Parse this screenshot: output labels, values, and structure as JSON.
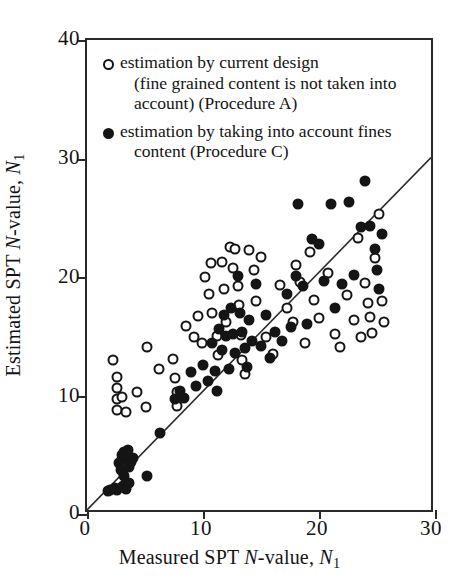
{
  "chart_data": {
    "type": "scatter",
    "title": "",
    "xlabel": "Measured SPT N-value, N1",
    "ylabel": "Estimated SPT N-value, N1",
    "xlim": [
      0,
      30
    ],
    "ylim": [
      0,
      40
    ],
    "xticks": [
      0,
      10,
      20,
      30
    ],
    "yticks": [
      0,
      10,
      20,
      30,
      40
    ],
    "grid": false,
    "legend_position": "upper-left-inside",
    "reference_line": {
      "name": "1:1 line",
      "from": [
        0,
        0
      ],
      "to": [
        30,
        30
      ],
      "style": "solid"
    },
    "series": [
      {
        "name": "estimation by current design (fine grained content is not taken into account) (Procedure A)",
        "marker": "open-circle",
        "color": "#151515",
        "points": [
          [
            2.2,
            13.0
          ],
          [
            2.6,
            11.6
          ],
          [
            2.6,
            10.6
          ],
          [
            2.6,
            9.7
          ],
          [
            2.6,
            8.8
          ],
          [
            3.0,
            9.9
          ],
          [
            3.4,
            8.6
          ],
          [
            4.3,
            10.3
          ],
          [
            5.1,
            9.0
          ],
          [
            5.2,
            14.1
          ],
          [
            6.2,
            12.2
          ],
          [
            7.4,
            13.1
          ],
          [
            7.6,
            11.5
          ],
          [
            7.8,
            10.3
          ],
          [
            7.8,
            9.1
          ],
          [
            8.5,
            15.9
          ],
          [
            9.2,
            14.9
          ],
          [
            9.6,
            16.7
          ],
          [
            9.9,
            14.4
          ],
          [
            10.2,
            20.0
          ],
          [
            10.5,
            18.6
          ],
          [
            10.7,
            21.2
          ],
          [
            10.8,
            17.0
          ],
          [
            11.2,
            15.0
          ],
          [
            11.3,
            13.4
          ],
          [
            11.6,
            21.3
          ],
          [
            11.8,
            19.0
          ],
          [
            12.0,
            16.2
          ],
          [
            12.3,
            22.5
          ],
          [
            12.6,
            20.8
          ],
          [
            12.8,
            22.4
          ],
          [
            13.0,
            19.2
          ],
          [
            13.1,
            17.6
          ],
          [
            13.3,
            15.1
          ],
          [
            13.4,
            13.0
          ],
          [
            13.6,
            11.8
          ],
          [
            14.0,
            22.3
          ],
          [
            14.4,
            20.6
          ],
          [
            14.6,
            18.0
          ],
          [
            15.0,
            21.7
          ],
          [
            15.4,
            14.9
          ],
          [
            16.0,
            13.5
          ],
          [
            16.6,
            19.3
          ],
          [
            17.2,
            17.4
          ],
          [
            17.8,
            16.2
          ],
          [
            18.0,
            21.0
          ],
          [
            18.4,
            19.6
          ],
          [
            18.8,
            14.4
          ],
          [
            19.2,
            22.1
          ],
          [
            19.6,
            18.1
          ],
          [
            20.0,
            16.5
          ],
          [
            20.8,
            20.3
          ],
          [
            21.4,
            15.2
          ],
          [
            21.8,
            14.1
          ],
          [
            22.4,
            18.5
          ],
          [
            23.0,
            16.4
          ],
          [
            23.4,
            23.3
          ],
          [
            23.6,
            14.9
          ],
          [
            24.0,
            19.5
          ],
          [
            24.2,
            17.8
          ],
          [
            24.4,
            16.6
          ],
          [
            24.6,
            15.3
          ],
          [
            24.8,
            21.6
          ],
          [
            25.2,
            25.3
          ],
          [
            25.4,
            18.0
          ],
          [
            25.6,
            16.2
          ]
        ]
      },
      {
        "name": "estimation by taking into account fines content (Procedure C)",
        "marker": "filled-circle",
        "color": "#151515",
        "points": [
          [
            1.8,
            1.9
          ],
          [
            2.0,
            2.0
          ],
          [
            2.4,
            2.2
          ],
          [
            2.6,
            2.0
          ],
          [
            2.8,
            4.3
          ],
          [
            2.9,
            3.7
          ],
          [
            3.0,
            5.0
          ],
          [
            3.0,
            4.6
          ],
          [
            3.1,
            2.4
          ],
          [
            3.2,
            5.2
          ],
          [
            3.2,
            3.2
          ],
          [
            3.3,
            4.9
          ],
          [
            3.4,
            2.1
          ],
          [
            3.5,
            5.4
          ],
          [
            3.6,
            4.0
          ],
          [
            3.6,
            2.6
          ],
          [
            3.8,
            4.4
          ],
          [
            4.0,
            4.7
          ],
          [
            5.2,
            3.2
          ],
          [
            6.3,
            6.8
          ],
          [
            7.6,
            9.7
          ],
          [
            8.0,
            10.4
          ],
          [
            8.4,
            9.8
          ],
          [
            9.0,
            12.0
          ],
          [
            9.4,
            10.8
          ],
          [
            10.0,
            12.6
          ],
          [
            10.4,
            11.2
          ],
          [
            10.8,
            14.4
          ],
          [
            11.0,
            12.1
          ],
          [
            11.2,
            10.4
          ],
          [
            11.4,
            15.6
          ],
          [
            11.6,
            13.8
          ],
          [
            11.8,
            16.8
          ],
          [
            12.0,
            15.0
          ],
          [
            12.2,
            12.2
          ],
          [
            12.4,
            17.4
          ],
          [
            12.6,
            15.2
          ],
          [
            12.8,
            13.6
          ],
          [
            13.0,
            20.1
          ],
          [
            13.2,
            17.0
          ],
          [
            13.4,
            15.4
          ],
          [
            13.6,
            14.0
          ],
          [
            13.8,
            12.4
          ],
          [
            14.0,
            16.4
          ],
          [
            14.2,
            14.6
          ],
          [
            14.6,
            19.4
          ],
          [
            15.0,
            14.2
          ],
          [
            15.4,
            16.8
          ],
          [
            15.8,
            13.2
          ],
          [
            16.2,
            15.4
          ],
          [
            16.8,
            14.6
          ],
          [
            17.2,
            18.6
          ],
          [
            17.6,
            15.8
          ],
          [
            18.0,
            20.1
          ],
          [
            18.2,
            26.2
          ],
          [
            18.6,
            19.2
          ],
          [
            19.0,
            16.0
          ],
          [
            19.4,
            23.2
          ],
          [
            20.0,
            22.8
          ],
          [
            20.4,
            19.7
          ],
          [
            21.0,
            26.2
          ],
          [
            21.4,
            17.4
          ],
          [
            22.0,
            19.4
          ],
          [
            22.6,
            26.3
          ],
          [
            23.0,
            20.2
          ],
          [
            23.6,
            24.2
          ],
          [
            24.0,
            28.1
          ],
          [
            24.4,
            24.3
          ],
          [
            24.8,
            22.4
          ],
          [
            25.0,
            20.6
          ],
          [
            25.2,
            19.0
          ],
          [
            25.4,
            23.6
          ]
        ]
      }
    ]
  },
  "axes": {
    "x_ticks": [
      "0",
      "10",
      "20",
      "30"
    ],
    "y_ticks": [
      "0",
      "10",
      "20",
      "30",
      "40"
    ],
    "x_title_parts": {
      "a": "Measured SPT ",
      "n": "N",
      "b": "-value, ",
      "n2": "N",
      "sub": "1"
    },
    "y_title_parts": {
      "a": "Estimated SPT ",
      "n": "N",
      "b": "-value, ",
      "n2": "N",
      "sub": "1"
    }
  },
  "legend": {
    "items": [
      {
        "marker": "open-circle",
        "line1": "estimation by current design",
        "line2": "(fine grained content is not taken into",
        "line3": "account) (Procedure A)"
      },
      {
        "marker": "filled-circle",
        "line1": "estimation by taking into account fines",
        "line2": "content (Procedure C)",
        "line3": ""
      }
    ]
  }
}
